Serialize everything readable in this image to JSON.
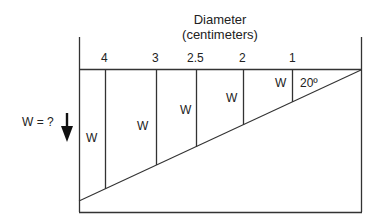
{
  "diagram": {
    "title_line1": "Diameter",
    "title_line2": "(centimeters)",
    "diameters": [
      "4",
      "3",
      "2.5",
      "2",
      "1"
    ],
    "weight_label": "W",
    "angle_label": "20º",
    "unknown_label": "W = ?",
    "arrow_icon": "down-arrow",
    "colors": {
      "line": "#333333",
      "text": "#222222",
      "background": "#ffffff"
    }
  }
}
